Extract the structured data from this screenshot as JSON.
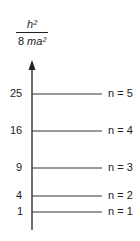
{
  "axis": {
    "label_numerator": "h²",
    "label_denominator_coef": "8 ",
    "label_denominator_var": "ma²"
  },
  "levels": [
    {
      "value": "25",
      "label": "n = 5",
      "y": 94
    },
    {
      "value": "16",
      "label": "n = 4",
      "y": 131
    },
    {
      "value": "9",
      "label": "n = 3",
      "y": 168
    },
    {
      "value": "4",
      "label": "n = 2",
      "y": 196
    },
    {
      "value": "1",
      "label": "n = 1",
      "y": 212
    }
  ]
}
